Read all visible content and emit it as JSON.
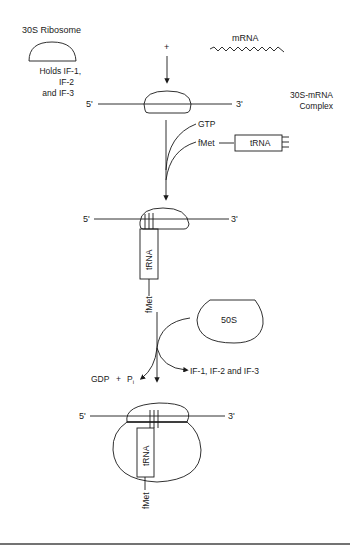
{
  "diagram": {
    "stage1": {
      "ribosome_label": "30S Ribosome",
      "holds_line1": "Holds IF-1,",
      "holds_line2": "IF-2",
      "holds_line3": "and IF-3",
      "plus_sign": "+",
      "mrna_label": "mRNA"
    },
    "stage2": {
      "five_prime": "5'",
      "three_prime": "3'",
      "complex_line1": "30S-mRNA",
      "complex_line2": "Complex",
      "gtp_label": "GTP",
      "fmet_label": "fMet",
      "trna_label": "tRNA"
    },
    "stage3": {
      "five_prime": "5'",
      "three_prime": "3'",
      "trna_label": "tRNA",
      "fmet_label": "fMet"
    },
    "stage4": {
      "subunit_label": "50S",
      "gdp_label": "GDP",
      "plus": "+",
      "pi_label": "P",
      "pi_sub": "i",
      "factors_label": "IF-1, IF-2 and IF-3"
    },
    "stage5": {
      "five_prime": "5'",
      "three_prime": "3'",
      "trna_label": "tRNA",
      "fmet_label": "fMet"
    },
    "colors": {
      "line": "#1a1a1a",
      "background": "#ffffff"
    }
  }
}
